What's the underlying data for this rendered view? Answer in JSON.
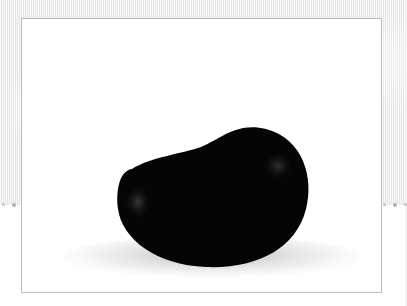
{
  "image": {
    "subject": "black bean",
    "description": "Glossy black kidney-shaped bean photographed on a white background inside a thin-bordered frame, over a faint light-gray patterned backdrop",
    "colors": {
      "bean": "#050505",
      "highlight": "#3a3a3a",
      "frame_background": "#ffffff",
      "frame_border": "#bdbdbd",
      "backdrop": "#ececec"
    }
  },
  "decorations": {
    "left_dots": 3,
    "right_dots": 3
  }
}
